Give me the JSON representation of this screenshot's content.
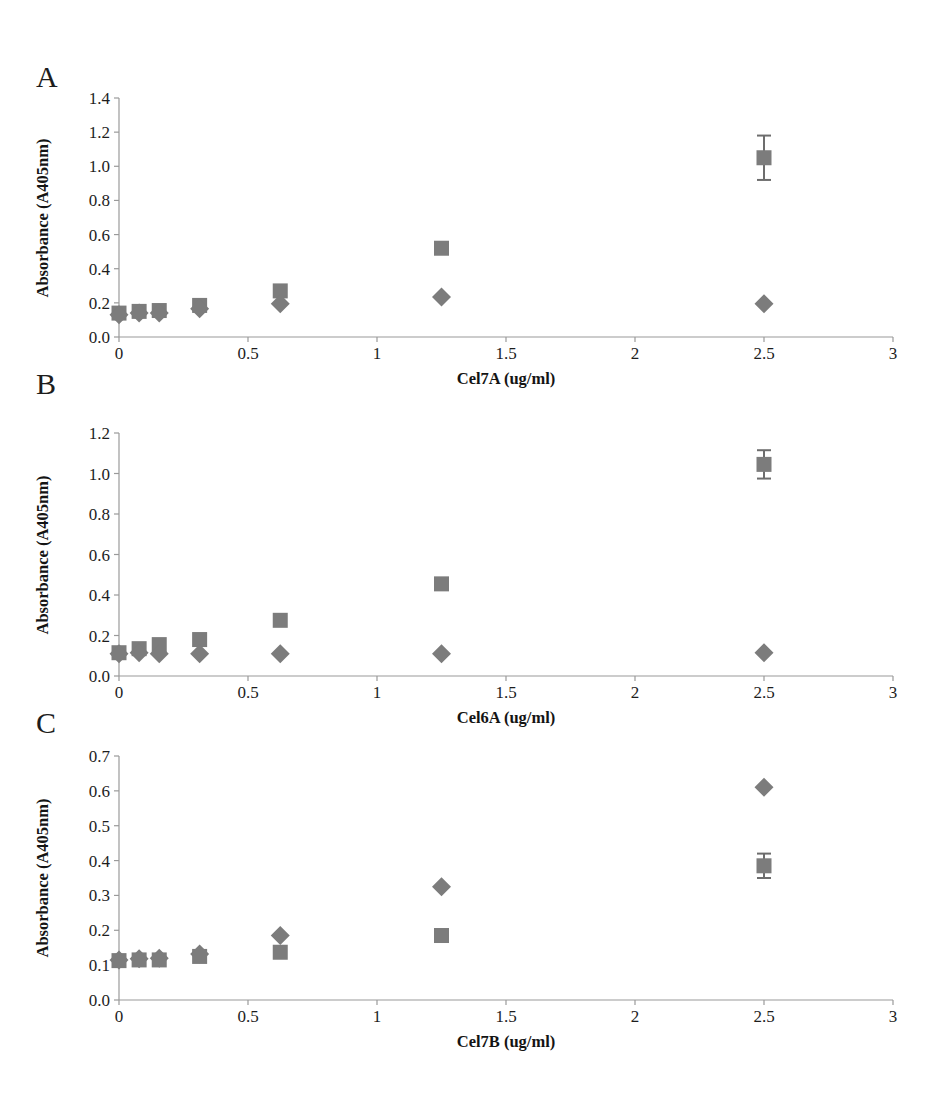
{
  "figure": {
    "marker_color": "#7c7c7c",
    "axis_color": "#9a9a9a",
    "error_bar_color": "#6d6d6d",
    "ylabel": "Absorbance (A405nm)"
  },
  "panels": [
    {
      "letter": "A",
      "xlabel": "Cel7A (ug/ml)",
      "ylabel": "Absorbance (A405nm)",
      "xticks": [
        "0",
        "0.5",
        "1",
        "1.5",
        "2",
        "2.5",
        "3"
      ],
      "yticks": [
        "0.0",
        "0.2",
        "0.4",
        "0.6",
        "0.8",
        "1.0",
        "1.2",
        "1.4"
      ]
    },
    {
      "letter": "B",
      "xlabel": "Cel6A (ug/ml)",
      "ylabel": "Absorbance (A405nm)",
      "xticks": [
        "0",
        "0.5",
        "1",
        "1.5",
        "2",
        "2.5",
        "3"
      ],
      "yticks": [
        "0.0",
        "0.2",
        "0.4",
        "0.6",
        "0.8",
        "1.0",
        "1.2"
      ]
    },
    {
      "letter": "C",
      "xlabel": "Cel7B (ug/ml)",
      "ylabel": "Absorbance (A405nm)",
      "xticks": [
        "0",
        "0.5",
        "1",
        "1.5",
        "2",
        "2.5",
        "3"
      ],
      "yticks": [
        "0.0",
        "0.1",
        "0.2",
        "0.3",
        "0.4",
        "0.5",
        "0.6",
        "0.7"
      ]
    }
  ],
  "chart_data": [
    {
      "type": "scatter",
      "title": "A",
      "xlabel": "Cel7A (ug/ml)",
      "ylabel": "Absorbance (A405nm)",
      "xlim": [
        0,
        3
      ],
      "ylim": [
        0,
        1.4
      ],
      "xticks": [
        0,
        0.5,
        1,
        1.5,
        2,
        2.5,
        3
      ],
      "yticks": [
        0.0,
        0.2,
        0.4,
        0.6,
        0.8,
        1.0,
        1.2,
        1.4
      ],
      "grid": false,
      "legend": "none",
      "x": [
        0,
        0.078,
        0.156,
        0.3125,
        0.625,
        1.25,
        2.5
      ],
      "series": [
        {
          "name": "square-series",
          "marker": "square",
          "values": [
            0.14,
            0.15,
            0.155,
            0.185,
            0.27,
            0.52,
            1.05
          ],
          "errors": [
            0,
            0,
            0,
            0,
            0,
            0,
            0.13
          ]
        },
        {
          "name": "diamond-series",
          "marker": "diamond",
          "values": [
            0.13,
            0.14,
            0.14,
            0.165,
            0.195,
            0.235,
            0.195
          ],
          "errors": [
            0,
            0,
            0,
            0,
            0,
            0,
            0
          ]
        }
      ]
    },
    {
      "type": "scatter",
      "title": "B",
      "xlabel": "Cel6A (ug/ml)",
      "ylabel": "Absorbance (A405nm)",
      "xlim": [
        0,
        3
      ],
      "ylim": [
        0,
        1.2
      ],
      "xticks": [
        0,
        0.5,
        1,
        1.5,
        2,
        2.5,
        3
      ],
      "yticks": [
        0.0,
        0.2,
        0.4,
        0.6,
        0.8,
        1.0,
        1.2
      ],
      "grid": false,
      "legend": "none",
      "x": [
        0,
        0.078,
        0.156,
        0.3125,
        0.625,
        1.25,
        2.5
      ],
      "series": [
        {
          "name": "square-series",
          "marker": "square",
          "values": [
            0.115,
            0.135,
            0.155,
            0.18,
            0.275,
            0.455,
            1.045
          ],
          "errors": [
            0,
            0,
            0,
            0,
            0,
            0,
            0.07
          ]
        },
        {
          "name": "diamond-series",
          "marker": "diamond",
          "values": [
            0.11,
            0.115,
            0.11,
            0.11,
            0.11,
            0.11,
            0.115
          ],
          "errors": [
            0,
            0,
            0,
            0,
            0,
            0,
            0
          ]
        }
      ]
    },
    {
      "type": "scatter",
      "title": "C",
      "xlabel": "Cel7B (ug/ml)",
      "ylabel": "Absorbance (A405nm)",
      "xlim": [
        0,
        3
      ],
      "ylim": [
        0,
        0.7
      ],
      "xticks": [
        0,
        0.5,
        1,
        1.5,
        2,
        2.5,
        3
      ],
      "yticks": [
        0.0,
        0.1,
        0.2,
        0.3,
        0.4,
        0.5,
        0.6,
        0.7
      ],
      "grid": false,
      "legend": "none",
      "x": [
        0,
        0.078,
        0.156,
        0.3125,
        0.625,
        1.25,
        2.5
      ],
      "series": [
        {
          "name": "diamond-series",
          "marker": "diamond",
          "values": [
            0.115,
            0.118,
            0.12,
            0.132,
            0.185,
            0.325,
            0.61
          ],
          "errors": [
            0,
            0,
            0,
            0,
            0,
            0,
            0
          ]
        },
        {
          "name": "square-series",
          "marker": "square",
          "values": [
            0.113,
            0.115,
            0.115,
            0.125,
            0.137,
            0.185,
            0.385
          ],
          "errors": [
            0,
            0,
            0,
            0,
            0,
            0,
            0.035
          ]
        }
      ]
    }
  ]
}
